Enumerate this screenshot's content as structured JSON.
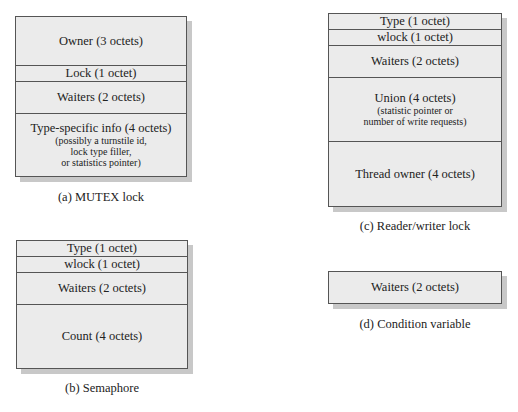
{
  "diagrams": {
    "mutex": {
      "caption": "(a) MUTEX lock",
      "fields": [
        {
          "label": "Owner (3 octets)"
        },
        {
          "label": "Lock (1 octet)"
        },
        {
          "label": "Waiters (2 octets)"
        },
        {
          "label": "Type-specific info (4 octets)",
          "notes": [
            "(possibly a turnstile id,",
            "lock type filler,",
            "or statistics pointer)"
          ]
        }
      ]
    },
    "semaphore": {
      "caption": "(b) Semaphore",
      "fields": [
        {
          "label": "Type (1 octet)"
        },
        {
          "label": "wlock (1 octet)"
        },
        {
          "label": "Waiters (2 octets)"
        },
        {
          "label": "Count (4 octets)"
        }
      ]
    },
    "rwlock": {
      "caption": "(c) Reader/writer lock",
      "fields": [
        {
          "label": "Type (1 octet)"
        },
        {
          "label": "wlock (1 octet)"
        },
        {
          "label": "Waiters (2 octets)"
        },
        {
          "label": "Union (4 octets)",
          "notes": [
            "(statistic pointer or",
            "number of write requests)"
          ]
        },
        {
          "label": "Thread owner (4 octets)"
        }
      ]
    },
    "condvar": {
      "caption": "(d) Condition variable",
      "fields": [
        {
          "label": "Waiters (2 octets)"
        }
      ]
    }
  }
}
